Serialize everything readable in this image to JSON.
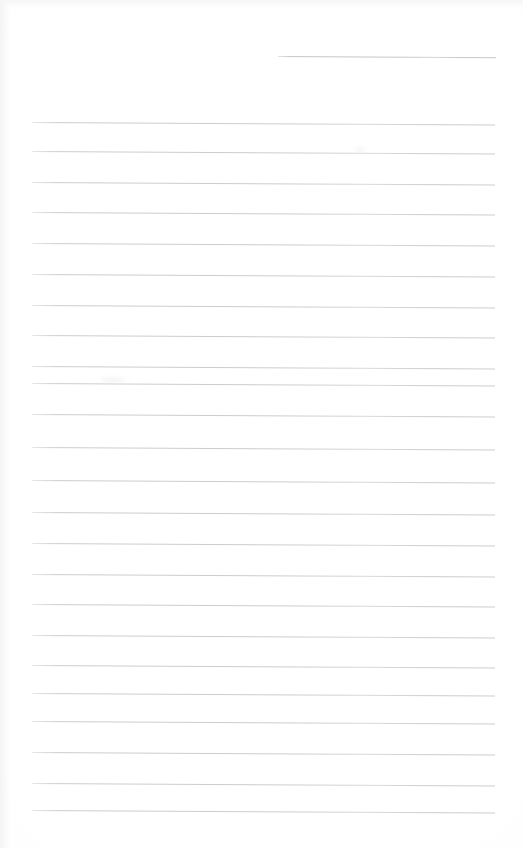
{
  "document": {
    "title": "Blank ruled notepad page",
    "kind": "scanned-lined-paper",
    "page_width": 523,
    "page_height": 848,
    "background_color": "#fefefe",
    "rule_color": "#c9cacd",
    "rule_thickness_px": 1,
    "rule_skew_degrees": 0.32,
    "left_margin_x": 32,
    "right_margin_x": 495,
    "text_content": "",
    "handwriting_present": false
  },
  "rules": [
    {
      "id": "rule-partial-1",
      "x": 278,
      "y": 56,
      "width": 218,
      "partial": true
    },
    {
      "id": "rule-1",
      "x": 32,
      "y": 122,
      "width": 463,
      "partial": false
    },
    {
      "id": "rule-2",
      "x": 32,
      "y": 151,
      "width": 463,
      "partial": false
    },
    {
      "id": "rule-3",
      "x": 32,
      "y": 182,
      "width": 463,
      "partial": false
    },
    {
      "id": "rule-4",
      "x": 32,
      "y": 212,
      "width": 463,
      "partial": false
    },
    {
      "id": "rule-5",
      "x": 32,
      "y": 243,
      "width": 463,
      "partial": false
    },
    {
      "id": "rule-6",
      "x": 32,
      "y": 274,
      "width": 463,
      "partial": false
    },
    {
      "id": "rule-7",
      "x": 32,
      "y": 305,
      "width": 463,
      "partial": false
    },
    {
      "id": "rule-8",
      "x": 32,
      "y": 335,
      "width": 463,
      "partial": false
    },
    {
      "id": "rule-9",
      "x": 32,
      "y": 366,
      "width": 463,
      "partial": false
    },
    {
      "id": "rule-10",
      "x": 32,
      "y": 383,
      "width": 463,
      "partial": false
    },
    {
      "id": "rule-11",
      "x": 32,
      "y": 414,
      "width": 463,
      "partial": false
    },
    {
      "id": "rule-12",
      "x": 32,
      "y": 447,
      "width": 463,
      "partial": false
    },
    {
      "id": "rule-13",
      "x": 32,
      "y": 480,
      "width": 463,
      "partial": false
    },
    {
      "id": "rule-14",
      "x": 32,
      "y": 512,
      "width": 463,
      "partial": false
    },
    {
      "id": "rule-15",
      "x": 32,
      "y": 543,
      "width": 463,
      "partial": false
    },
    {
      "id": "rule-16",
      "x": 32,
      "y": 574,
      "width": 463,
      "partial": false
    },
    {
      "id": "rule-17",
      "x": 32,
      "y": 604,
      "width": 463,
      "partial": false
    },
    {
      "id": "rule-18",
      "x": 32,
      "y": 635,
      "width": 463,
      "partial": false
    },
    {
      "id": "rule-19",
      "x": 32,
      "y": 665,
      "width": 463,
      "partial": false
    },
    {
      "id": "rule-20",
      "x": 32,
      "y": 693,
      "width": 463,
      "partial": false
    },
    {
      "id": "rule-21",
      "x": 32,
      "y": 721,
      "width": 463,
      "partial": false
    },
    {
      "id": "rule-22",
      "x": 32,
      "y": 752,
      "width": 463,
      "partial": false
    },
    {
      "id": "rule-23",
      "x": 32,
      "y": 783,
      "width": 463,
      "partial": false
    },
    {
      "id": "rule-24",
      "x": 32,
      "y": 810,
      "width": 463,
      "partial": false
    }
  ],
  "artifacts": [
    {
      "id": "smudge-1",
      "x": 100,
      "y": 378,
      "width": 26,
      "height": 4
    },
    {
      "id": "smudge-2",
      "x": 355,
      "y": 148,
      "width": 10,
      "height": 3
    }
  ]
}
